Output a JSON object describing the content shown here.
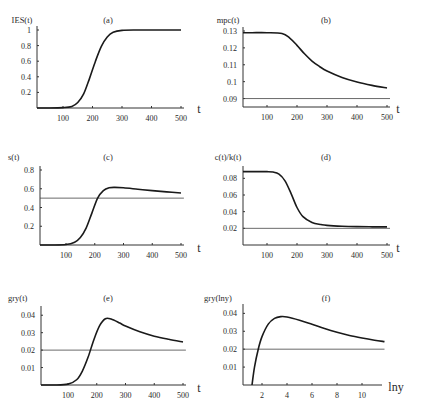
{
  "chart_data": [
    {
      "panel": "(a)",
      "type": "line",
      "ylabel": "IES(t)",
      "xlabel": "t",
      "xticks": [
        100,
        200,
        300,
        400,
        500
      ],
      "yticks": [
        "0.2",
        "0.4",
        "0.6",
        "0.8",
        "1"
      ],
      "xlim": [
        0,
        510
      ],
      "ylim": [
        0,
        1.0
      ],
      "x": [
        0,
        50,
        100,
        130,
        150,
        170,
        190,
        210,
        230,
        250,
        270,
        300,
        350,
        400,
        450,
        500
      ],
      "series": [
        {
          "name": "IES(t)",
          "values": [
            0.0,
            0.0,
            0.005,
            0.02,
            0.07,
            0.18,
            0.38,
            0.6,
            0.79,
            0.91,
            0.97,
            0.995,
            1.0,
            1.0,
            1.0,
            1.0
          ]
        }
      ],
      "reference_line": null
    },
    {
      "panel": "(b)",
      "type": "line",
      "ylabel": "mpc(t)",
      "xlabel": "t",
      "xticks": [
        100,
        200,
        300,
        400,
        500
      ],
      "yticks": [
        "0.09",
        "0.1",
        "0.11",
        "0.12",
        "0.13"
      ],
      "xlim": [
        0,
        510
      ],
      "ylim": [
        0.085,
        0.13
      ],
      "x": [
        0,
        50,
        100,
        150,
        175,
        200,
        225,
        250,
        275,
        300,
        350,
        400,
        450,
        500
      ],
      "series": [
        {
          "name": "mpc(t)",
          "values": [
            0.129,
            0.129,
            0.129,
            0.1285,
            0.126,
            0.1215,
            0.1165,
            0.1122,
            0.109,
            0.1063,
            0.1025,
            0.0998,
            0.0978,
            0.0962
          ]
        }
      ],
      "reference_line": 0.09
    },
    {
      "panel": "(c)",
      "type": "line",
      "ylabel": "s(t)",
      "xlabel": "t",
      "xticks": [
        100,
        200,
        300,
        400,
        500
      ],
      "yticks": [
        "0.2",
        "0.4",
        "0.6",
        "0.8"
      ],
      "xlim": [
        0,
        510
      ],
      "ylim": [
        0,
        0.8
      ],
      "x": [
        0,
        50,
        100,
        130,
        150,
        170,
        190,
        210,
        230,
        250,
        270,
        300,
        350,
        400,
        450,
        500
      ],
      "series": [
        {
          "name": "s(t)",
          "values": [
            0.0,
            0.0,
            0.005,
            0.03,
            0.08,
            0.18,
            0.34,
            0.5,
            0.58,
            0.61,
            0.615,
            0.61,
            0.595,
            0.58,
            0.567,
            0.555
          ]
        }
      ],
      "reference_line": 0.5
    },
    {
      "panel": "(d)",
      "type": "line",
      "ylabel": "c(t)/k(t)",
      "xlabel": "t",
      "xticks": [
        100,
        200,
        300,
        400,
        500
      ],
      "yticks": [
        "0.02",
        "0.04",
        "0.06",
        "0.08"
      ],
      "xlim": [
        0,
        510
      ],
      "ylim": [
        0,
        0.09
      ],
      "x": [
        0,
        50,
        100,
        120,
        140,
        160,
        180,
        200,
        220,
        250,
        280,
        300,
        350,
        400,
        450,
        500
      ],
      "series": [
        {
          "name": "c(t)/k(t)",
          "values": [
            0.088,
            0.088,
            0.088,
            0.0875,
            0.085,
            0.077,
            0.062,
            0.045,
            0.034,
            0.027,
            0.0245,
            0.0235,
            0.0225,
            0.022,
            0.0218,
            0.0217
          ]
        }
      ],
      "reference_line": 0.02
    },
    {
      "panel": "(e)",
      "type": "line",
      "ylabel": "gry(t)",
      "xlabel": "t",
      "xticks": [
        100,
        200,
        300,
        400,
        500
      ],
      "yticks": [
        "0.01",
        "0.02",
        "0.03",
        "0.04"
      ],
      "xlim": [
        0,
        510
      ],
      "ylim": [
        0,
        0.043
      ],
      "x": [
        0,
        50,
        100,
        130,
        150,
        170,
        190,
        210,
        230,
        250,
        280,
        300,
        350,
        400,
        450,
        500
      ],
      "series": [
        {
          "name": "gry(t)",
          "values": [
            0.0,
            0.0,
            0.0005,
            0.003,
            0.008,
            0.016,
            0.026,
            0.034,
            0.038,
            0.0378,
            0.0355,
            0.0338,
            0.0305,
            0.028,
            0.0262,
            0.0247
          ]
        }
      ],
      "reference_line": 0.02
    },
    {
      "panel": "(f)",
      "type": "line",
      "ylabel": "gry(lny)",
      "xlabel": "lny",
      "xticks": [
        2,
        4,
        6,
        8,
        10
      ],
      "yticks": [
        "0.01",
        "0.02",
        "0.03",
        "0.04"
      ],
      "xlim": [
        0,
        12
      ],
      "ylim": [
        0,
        0.043
      ],
      "x": [
        1.2,
        1.4,
        1.7,
        2.0,
        2.5,
        3.0,
        3.5,
        4.0,
        5.0,
        6.0,
        7.0,
        8.0,
        9.0,
        10.0,
        11.0,
        11.8
      ],
      "series": [
        {
          "name": "gry(lny)",
          "values": [
            0.0,
            0.01,
            0.02,
            0.027,
            0.034,
            0.0372,
            0.0382,
            0.038,
            0.0362,
            0.0339,
            0.0315,
            0.0294,
            0.0276,
            0.0262,
            0.025,
            0.0242
          ]
        }
      ],
      "reference_line": 0.02
    }
  ],
  "caption": {
    "visible": "partially clipped caption line (illegible)"
  }
}
